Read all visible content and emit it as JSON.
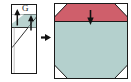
{
  "diagram": {
    "type": "instructional-fold-diagram",
    "background_color": "#ffffff",
    "steps": [
      {
        "index": 1,
        "name": "before-fold",
        "shape": "tall-narrow-rectangle",
        "label": "G",
        "fill_color": "#ffffff",
        "outline_color": "#1a1a1a",
        "flap_fill_color": "#b9d3d0",
        "annotations": [
          "fold-arrow-left",
          "fold-arrow-right",
          "diagonal-crease"
        ]
      },
      {
        "index": 2,
        "name": "after-fold",
        "shape": "octagon-square",
        "fill_color": "#b4d0cd",
        "band_color": "#cf5f6b",
        "outline_color": "#1a1a1a",
        "annotations": [
          "press-down-arrow"
        ]
      }
    ],
    "connector": {
      "name": "step-arrow",
      "direction": "right",
      "color": "#111111"
    },
    "colors": {
      "teal": "#b4d0cd",
      "teal_flap": "#b9d3d0",
      "red_band": "#cf5f6b",
      "red_band_dark": "#b94a58",
      "outline": "#1a1a1a",
      "paper_white": "#ffffff",
      "arrow": "#111111"
    }
  }
}
